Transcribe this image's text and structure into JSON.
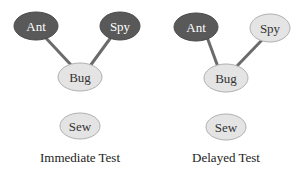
{
  "colors": {
    "active_fill": "#595959",
    "active_text": "#ffffff",
    "inactive_fill": "#e4e4e4",
    "inactive_stroke": "#b0b0b0",
    "inactive_text": "#333333",
    "edge": "#6b6b6b"
  },
  "panels": [
    {
      "caption": "Immediate Test",
      "nodes": [
        {
          "label": "Ant",
          "state": "active"
        },
        {
          "label": "Spy",
          "state": "active"
        },
        {
          "label": "Bug",
          "state": "inactive"
        },
        {
          "label": "Sew",
          "state": "inactive"
        }
      ],
      "edges": [
        [
          "Ant",
          "Bug"
        ],
        [
          "Spy",
          "Bug"
        ]
      ]
    },
    {
      "caption": "Delayed Test",
      "nodes": [
        {
          "label": "Ant",
          "state": "active"
        },
        {
          "label": "Spy",
          "state": "inactive"
        },
        {
          "label": "Bug",
          "state": "inactive"
        },
        {
          "label": "Sew",
          "state": "inactive"
        }
      ],
      "edges": [
        [
          "Ant",
          "Bug"
        ],
        [
          "Spy",
          "Bug"
        ]
      ]
    }
  ]
}
